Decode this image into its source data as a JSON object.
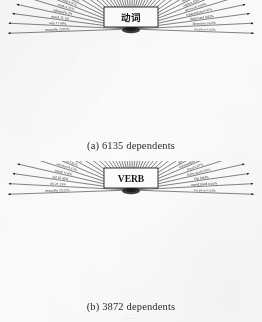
{
  "figure": {
    "background_color": "#fdfdfd",
    "ink_color": "#1d1d1d",
    "bottom_cut_text": "……"
  },
  "panels": [
    {
      "id": "a",
      "center_label": "动词",
      "caption": "(a) 6135 dependents",
      "center_box": {
        "width": 54,
        "height": 20,
        "stroke": "#1d1d1d"
      },
      "chart_data": {
        "type": "radial",
        "title": "动词",
        "total_dependents": 6135,
        "categories": [
          "comp:obj",
          "subj",
          "nmod",
          "advmod",
          "mark",
          "conj",
          "cc",
          "case",
          "aux",
          "comp:cleft",
          "acl",
          "comp:pred",
          "udep",
          "det",
          "obl",
          "amod",
          "xcomp",
          "nummod",
          "compound",
          "parataxis",
          "ccomp",
          "dep",
          "advcl",
          "csubj",
          "appos",
          "obl:tmod",
          "nmod:poss",
          "aux:pass",
          "cop",
          "expl",
          "fixed",
          "flat",
          "iobj",
          "list",
          "orphan",
          "goeswith",
          "reparandum",
          "dislocated",
          "discourse",
          "vocative"
        ],
        "values": [
          29.83,
          17.98,
          12.1,
          8.2,
          6.35,
          4.97,
          4.02,
          3.15,
          2.92,
          2.55,
          2.31,
          1.88,
          1.62,
          1.4,
          1.23,
          1.05,
          0.95,
          0.88,
          0.76,
          0.65,
          0.6,
          0.55,
          0.48,
          0.4,
          0.36,
          0.33,
          0.3,
          0.26,
          0.23,
          0.2,
          0.18,
          0.15,
          0.13,
          0.11,
          0.09,
          0.08,
          0.06,
          0.05,
          0.02,
          0.02
        ],
        "unit": "%",
        "xlabel": "",
        "ylabel": ""
      }
    },
    {
      "id": "b",
      "center_label": "VERB",
      "caption": "(b) 3872 dependents",
      "center_box": {
        "width": 54,
        "height": 20,
        "stroke": "#1d1d1d"
      },
      "chart_data": {
        "type": "radial",
        "title": "VERB",
        "total_dependents": 3872,
        "categories": [
          "comp:obj",
          "obj",
          "obl",
          "nmod",
          "advmod",
          "conj",
          "mark",
          "case",
          "cc",
          "aux",
          "acl",
          "comp:pred",
          "det",
          "xcomp",
          "amod",
          "nummod",
          "ccomp",
          "compound",
          "parataxis",
          "advcl",
          "dep",
          "csubj",
          "appos",
          "obl:tmod",
          "cop",
          "aux:pass",
          "expl",
          "iobj",
          "udep",
          "orphan",
          "list",
          "goeswith",
          "reparandum",
          "fixed",
          "dislocated",
          "flat",
          "nmod:tmod",
          "vocative"
        ],
        "values": [
          26.25,
          21.33,
          16.42,
          11.8,
          8.15,
          5.62,
          4.48,
          3.6,
          3.05,
          2.6,
          2.24,
          1.95,
          1.7,
          1.48,
          1.3,
          1.12,
          0.98,
          0.85,
          0.74,
          0.64,
          0.56,
          0.48,
          0.42,
          0.36,
          0.31,
          0.27,
          0.23,
          0.2,
          0.17,
          0.14,
          0.12,
          0.1,
          0.08,
          0.07,
          0.05,
          0.03,
          0.03,
          0.03
        ],
        "unit": "%",
        "xlabel": "",
        "ylabel": ""
      }
    }
  ]
}
